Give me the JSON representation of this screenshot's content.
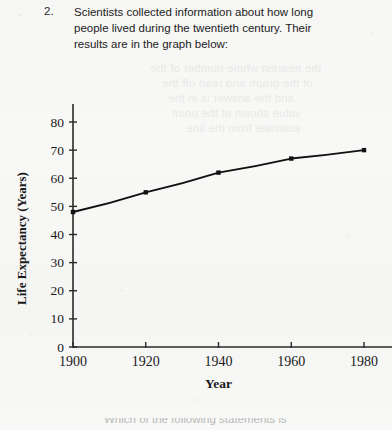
{
  "question": {
    "number": "2.",
    "text": "Scientists collected information about how long people lived during the twentieth century. Their results are in the graph below:"
  },
  "footer": {
    "cropped_text": "Which of the following statements is"
  },
  "ghost_text": {
    "lines": [
      "the nearest whole number of the",
      "of the graph and read off the",
      "and the answer is in the",
      "value shown at the point",
      "estimate from the line"
    ]
  },
  "colors": {
    "paper": "#f7f7f5",
    "ink": "#1a1a1a",
    "axis": "#2a2a2a",
    "ghost": "#e9e9e7"
  },
  "chart_data": {
    "type": "line",
    "title": "",
    "xlabel": "Year",
    "ylabel": "Life Expectancy (Years)",
    "x": [
      1900,
      1920,
      1940,
      1960,
      1980
    ],
    "values": [
      48,
      55,
      62,
      67,
      70
    ],
    "xlim": [
      1900,
      1980
    ],
    "ylim": [
      0,
      80
    ],
    "xticks": [
      "1900",
      "1920",
      "1940",
      "1960",
      "1980"
    ],
    "yticks": [
      "0",
      "10",
      "20",
      "30",
      "40",
      "50",
      "60",
      "70",
      "80"
    ],
    "grid": false,
    "legend": false,
    "marker": "square",
    "line_color": "#111111"
  }
}
